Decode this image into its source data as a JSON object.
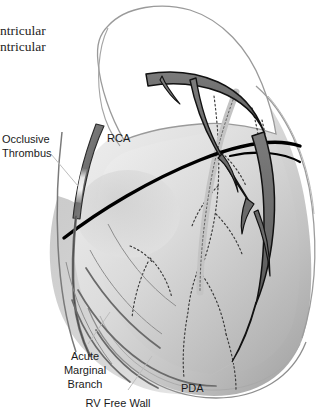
{
  "figure": {
    "kind": "anatomical-illustration",
    "background_color": "#ffffff",
    "palette": {
      "artery_fill": "#6e6e6e",
      "artery_stroke": "#111111",
      "collateral_fill": "#c9c9c9",
      "groove_black": "#000000",
      "ventricle_light": "#dcdcdc",
      "ventricle_mid": "#bdbdbd",
      "ventricle_dark": "#9a9a9a",
      "outline_gray": "#8a8a8a",
      "thrombus_fill": "#efefef",
      "label_color": "#1a1a1a",
      "leader_color": "#b4b4b4"
    }
  },
  "labels": [
    {
      "id": "left-ventricular",
      "text": "ntricular",
      "style": "serif",
      "align": "left",
      "x": 0,
      "y": 22
    },
    {
      "id": "right-ventricular",
      "text": "ntricular",
      "style": "serif",
      "align": "left",
      "x": 0,
      "y": 38
    },
    {
      "id": "occlusive-thrombus",
      "text": "Occlusive\nThrombus",
      "style": "sans",
      "align": "left",
      "x": 2,
      "y": 132
    },
    {
      "id": "rca",
      "text": "RCA",
      "style": "sans",
      "align": "left",
      "x": 107,
      "y": 131
    },
    {
      "id": "acute-marginal-branch",
      "text": "Acute\nMarginal\nBranch",
      "style": "sans",
      "align": "center",
      "x": 56,
      "y": 349
    },
    {
      "id": "rv-free-wall",
      "text": "RV Free Wall",
      "style": "sans",
      "align": "center",
      "x": 73,
      "y": 396
    },
    {
      "id": "pda",
      "text": "PDA",
      "style": "sans",
      "align": "left",
      "x": 181,
      "y": 381
    }
  ],
  "structures": [
    {
      "id": "right-atrial-appendage",
      "name": "Right atrial appendage"
    },
    {
      "id": "rca-trunk",
      "name": "Right coronary artery trunk"
    },
    {
      "id": "occlusive-thrombus-site",
      "name": "Occlusive thrombus within RCA"
    },
    {
      "id": "acute-marginal-branch-vessel",
      "name": "Acute marginal branch"
    },
    {
      "id": "posterior-descending-artery",
      "name": "Posterior descending artery"
    },
    {
      "id": "rv-free-wall-region",
      "name": "Right ventricular free wall"
    },
    {
      "id": "collateral-network",
      "name": "Dotted collateral vessels"
    },
    {
      "id": "av-groove",
      "name": "Atrioventricular groove"
    }
  ]
}
